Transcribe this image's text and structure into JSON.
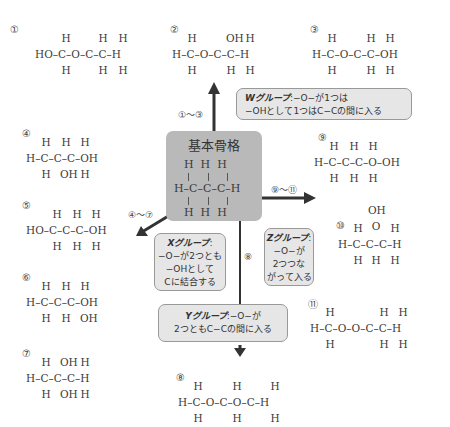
{
  "core": {
    "title": "基本骨格",
    "formula_rows": [
      "H  H  H",
      "H–C–C–C–H",
      "H  H  H"
    ]
  },
  "ranges": {
    "w": "①〜③",
    "x": "④〜⑦",
    "y": "⑧",
    "z": "⑨〜⑪"
  },
  "callouts": {
    "w": {
      "label": "Wグループ",
      "line1": ":−O−が1つは",
      "line2": "−OHとして1つはC−Cの間に入る"
    },
    "x": {
      "label": "Xグループ",
      "line1": ":",
      "line2": "−O−が2つとも",
      "line3": "−OHとして",
      "line4": "Cに結合する"
    },
    "y": {
      "label": "Yグループ",
      "line1": ":−O−が",
      "line2": "2つともC−Cの間に入る"
    },
    "z": {
      "label": "Zグループ",
      "line1": ":",
      "line2": "−O−が",
      "line3": "2つつな",
      "line4": "がって入る"
    }
  },
  "molecules": [
    {
      "num": "①",
      "top": [
        "H",
        "",
        "H",
        "H"
      ],
      "mid": "HO–C–O–C–C–H",
      "bot": [
        "H",
        "",
        "H",
        "H"
      ]
    },
    {
      "num": "②",
      "top": [
        "H",
        "",
        "OH",
        "H"
      ],
      "mid": "H–C–O–C–C–H",
      "bot": [
        "H",
        "",
        "H",
        "H"
      ]
    },
    {
      "num": "③",
      "top": [
        "H",
        "",
        "H",
        "H"
      ],
      "mid": "H–C–O–C–C–OH",
      "bot": [
        "H",
        "",
        "H",
        "H"
      ]
    },
    {
      "num": "④",
      "top": [
        "H",
        "H",
        "H"
      ],
      "mid": "H–C–C–C–OH",
      "bot": [
        "H",
        "OH",
        "H"
      ]
    },
    {
      "num": "⑤",
      "top": [
        "H",
        "H",
        "H"
      ],
      "mid": "HO–C–C–C–OH",
      "bot": [
        "H",
        "H",
        "H"
      ]
    },
    {
      "num": "⑥",
      "top": [
        "H",
        "H",
        "H"
      ],
      "mid": "H–C–C–C–OH",
      "bot": [
        "H",
        "H",
        "OH"
      ]
    },
    {
      "num": "⑦",
      "top": [
        "H",
        "OH",
        "H"
      ],
      "mid": "H–C–C–C–H",
      "bot": [
        "H",
        "OH",
        "H"
      ]
    },
    {
      "num": "⑧",
      "top": [
        "H",
        "H",
        "H"
      ],
      "mid": "H–C–O–C–O–C–H",
      "bot": [
        "H",
        "H",
        "H"
      ]
    },
    {
      "num": "⑨",
      "top": [
        "H",
        "H",
        "H"
      ],
      "mid": "H–C–C–C–O–OH",
      "bot": [
        "H",
        "H",
        "H"
      ]
    },
    {
      "num": "⑩",
      "extra_top": "OH",
      "extra_mid": "O",
      "top": [
        "H",
        "",
        "H"
      ],
      "mid": "H–C–C–C–H",
      "bot": [
        "H",
        "H",
        "H"
      ]
    },
    {
      "num": "⑪",
      "top": [
        "H",
        "",
        "H",
        "H"
      ],
      "mid": "H–C–O–O–C–C–H",
      "bot": [
        "H",
        "",
        "H",
        "H"
      ]
    }
  ]
}
